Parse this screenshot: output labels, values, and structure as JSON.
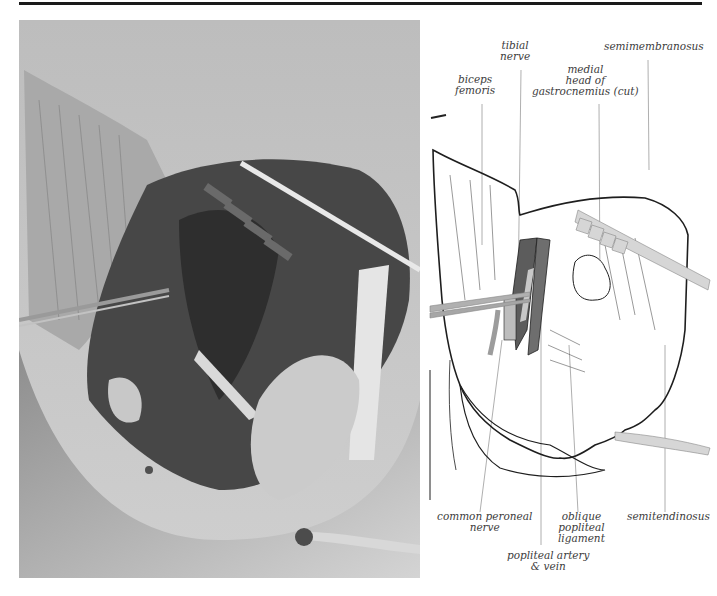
{
  "figure": {
    "photo_caption": "Surgical photograph of popliteal fossa exposure (posterior knee)",
    "drawing_caption": "Line drawing of the same operative field"
  },
  "labels": {
    "biceps_femoris": [
      "biceps",
      "femoris"
    ],
    "tibial_nerve": [
      "tibial",
      "nerve"
    ],
    "medial_gastrocnemius": [
      "medial",
      "head of",
      "gastrocnemius (cut)"
    ],
    "semimembranosus": [
      "semimembranosus"
    ],
    "common_peroneal_nerve": [
      "common peroneal",
      "nerve"
    ],
    "popliteal_artery_vein": [
      "popliteal artery",
      "& vein"
    ],
    "oblique_popliteal_ligament": [
      "oblique",
      "popliteal",
      "ligament"
    ],
    "semitendinosus": [
      "semitendinosus"
    ]
  },
  "colors": {
    "rule": "#1a1a1a",
    "outline": "#1e1e1e",
    "vessel_dark": "#5a5a5a",
    "vessel_mid": "#7a7a7a",
    "retractor_fill": "#d6d6d6",
    "leader": "#9a9a9a"
  }
}
